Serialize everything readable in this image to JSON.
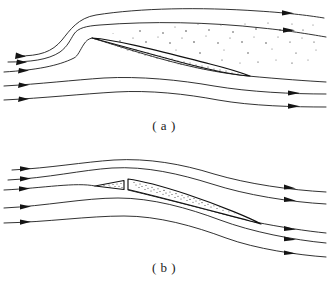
{
  "figure": {
    "background_color": "#ffffff",
    "line_color": "#1b1b1b",
    "arrow_color": "#141414",
    "stipple_color": "#2a2a2a",
    "width": 328,
    "height": 293
  },
  "panels": [
    {
      "id": "a",
      "caption": "( a )",
      "description": "Thin lens-shaped airfoil at zero incidence with detached stippled disturbance region above and behind the body; upper streamlines show a sharp kink ahead of the leading edge.",
      "inlet_arrow_count": 5,
      "outlet_arrow_count": 4,
      "streamline_count": 5,
      "body": {
        "name": "lens-airfoil",
        "leading_edge_x": 92,
        "trailing_edge_x": 248,
        "max_thickness": 11,
        "stippled": true
      },
      "stipple_region": {
        "name": "disturbance-region",
        "stippled": true,
        "density": "sparse"
      },
      "inlet_streamline_y": [
        40,
        56,
        70,
        84,
        98
      ],
      "outlet_streamline_y": [
        29,
        47,
        86,
        100
      ]
    },
    {
      "id": "b",
      "caption": "( b )",
      "description": "Thin airfoil at incidence with a small detached leading-edge wedge ahead of a blunt-nosed stippled blade; streamlines deflect downward past the body.",
      "inlet_arrow_count": 5,
      "outlet_arrow_count": 5,
      "streamline_count": 5,
      "body": {
        "name": "wedge-airfoil",
        "leading_edge_x": 128,
        "trailing_edge_x": 260,
        "max_thickness": 10,
        "stippled": true
      },
      "detached_piece": {
        "name": "detached-nose-wedge",
        "left_x": 95,
        "right_x": 124,
        "stippled": true
      },
      "inlet_streamline_y": [
        22,
        34,
        46,
        62,
        77
      ],
      "outlet_streamline_y": [
        30,
        44,
        57,
        72,
        87
      ]
    }
  ],
  "icons": {
    "flow_arrow": "arrowhead-right"
  }
}
